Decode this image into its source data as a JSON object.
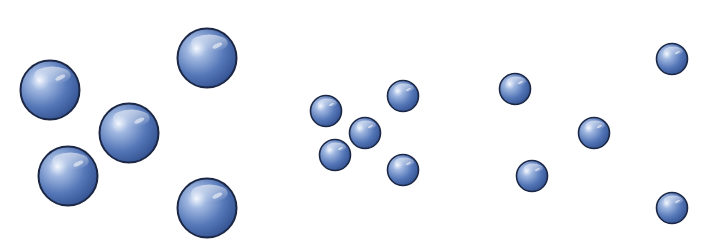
{
  "diagram": {
    "colors": {
      "background": "#ffffff",
      "sphere_highlight": "#f4f8ff",
      "sphere_light": "#9fb7e0",
      "sphere_mid": "#5577b8",
      "sphere_dark": "#2c4a88",
      "sphere_outline": "#1b2744"
    },
    "groups": [
      {
        "name": "group-1",
        "label": "",
        "particle_count": 5,
        "particle_size": "large",
        "spacing": "close",
        "particles": [
          {
            "id": "p1",
            "position": "left"
          },
          {
            "id": "p2",
            "position": "top-right"
          },
          {
            "id": "p3",
            "position": "center"
          },
          {
            "id": "p4",
            "position": "bottom-left"
          },
          {
            "id": "p5",
            "position": "bottom-right"
          }
        ]
      },
      {
        "name": "group-2",
        "label": "",
        "particle_count": 5,
        "particle_size": "small",
        "spacing": "close",
        "particles": [
          {
            "id": "p1",
            "position": "left"
          },
          {
            "id": "p2",
            "position": "top-right"
          },
          {
            "id": "p3",
            "position": "center"
          },
          {
            "id": "p4",
            "position": "bottom-left"
          },
          {
            "id": "p5",
            "position": "bottom-right"
          }
        ]
      },
      {
        "name": "group-3",
        "label": "",
        "particle_count": 5,
        "particle_size": "small",
        "spacing": "wide",
        "particles": [
          {
            "id": "p1",
            "position": "left"
          },
          {
            "id": "p2",
            "position": "top-right"
          },
          {
            "id": "p3",
            "position": "center"
          },
          {
            "id": "p4",
            "position": "bottom-left"
          },
          {
            "id": "p5",
            "position": "bottom-right"
          }
        ]
      }
    ]
  }
}
